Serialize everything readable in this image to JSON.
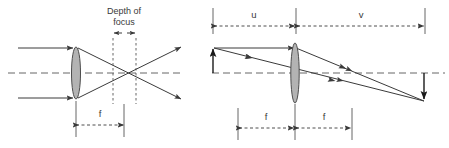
{
  "figure": {
    "background": "#ffffff",
    "line_color": "#3a3a3a",
    "axis_color": "#666666",
    "lens_fill": "#b3b3b3",
    "lens_stroke": "#4d4d4d",
    "width": 449,
    "height": 148
  },
  "left_diagram": {
    "name": "depth-of-focus-diagram",
    "labels": {
      "depth_of_focus_line1": "Depth of",
      "depth_of_focus_line2": "focus",
      "focal_length": "f"
    },
    "elements": {
      "lens": "biconvex-lens",
      "optical_axis": "dashed-horizontal-axis",
      "incoming_rays": 2,
      "outgoing_rays": 2,
      "focus_markers": 2
    }
  },
  "right_diagram": {
    "name": "object-image-diagram",
    "labels": {
      "object_distance": "u",
      "image_distance": "v",
      "focal_length_left": "f",
      "focal_length_right": "f"
    },
    "elements": {
      "lens": "biconvex-lens",
      "optical_axis": "dashed-horizontal-axis",
      "object_arrow": "upward-arrow",
      "image_arrow": "downward-arrow",
      "rays": 2
    }
  }
}
